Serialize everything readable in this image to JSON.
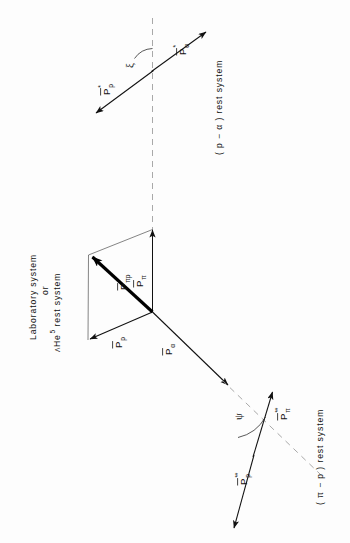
{
  "figure": {
    "background_color": "#fdfdfd",
    "ink_color": "#111111",
    "dashed_color": "#9a9a9a",
    "orientation_note": "page rotated 90 degrees; all text reads bottom-to-top"
  },
  "frames": {
    "laboratory": {
      "line1": "Laboratory  system",
      "line2": "or",
      "line3_prefix": "Λ",
      "line3_element": "He",
      "line3_superscript": "5",
      "line3_suffix": "rest  system"
    },
    "p_alpha": {
      "label": "( p − α )  rest  system"
    },
    "pi_p": {
      "label": "( π − p )  rest  system"
    }
  },
  "vectors": {
    "lab": [
      {
        "name": "p-pi-p",
        "symbol": "P",
        "overbar": true,
        "subscript": "πp",
        "superscript": "",
        "style": "thick"
      },
      {
        "name": "p-pi",
        "symbol": "P",
        "overbar": true,
        "subscript": "π",
        "superscript": "",
        "style": "thin"
      },
      {
        "name": "p-proton",
        "symbol": "P",
        "overbar": true,
        "subscript": "p",
        "superscript": "",
        "style": "thin"
      },
      {
        "name": "p-alpha",
        "symbol": "P",
        "overbar": true,
        "subscript": "α",
        "superscript": "",
        "style": "thin"
      }
    ],
    "p_alpha_frame": [
      {
        "name": "p-proton-star",
        "symbol": "P",
        "overbar": true,
        "subscript": "p",
        "superscript": "*",
        "style": "thin"
      },
      {
        "name": "p-alpha-star",
        "symbol": "P",
        "overbar": true,
        "subscript": "α",
        "superscript": "*",
        "style": "thin"
      }
    ],
    "pi_p_frame": [
      {
        "name": "p-pi-doublestar",
        "symbol": "P",
        "overbar": true,
        "subscript": "π",
        "superscript": "**",
        "style": "thin"
      },
      {
        "name": "p-proton-doublestar",
        "symbol": "P",
        "overbar": true,
        "subscript": "p",
        "superscript": "**",
        "style": "thin"
      }
    ]
  },
  "angles": [
    {
      "name": "xi",
      "glyph": "ξ",
      "frame": "p_alpha"
    },
    {
      "name": "psi",
      "glyph": "ψ",
      "frame": "pi_p"
    }
  ],
  "glyphs": {
    "overbar": "̄",
    "star": "*",
    "doublestar": "**",
    "pi": "π",
    "alpha": "α",
    "lambda": "Λ",
    "xi": "ξ",
    "psi": "ψ"
  }
}
